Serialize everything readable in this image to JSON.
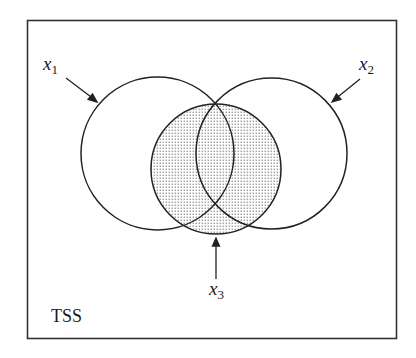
{
  "diagram": {
    "type": "venn",
    "frame_label": "TSS",
    "sets": [
      {
        "id": "x1",
        "symbol": "x",
        "subscript": "1",
        "shaded": false
      },
      {
        "id": "x2",
        "symbol": "x",
        "subscript": "2",
        "shaded": false
      },
      {
        "id": "x3",
        "symbol": "x",
        "subscript": "3",
        "shaded": true
      }
    ],
    "colors": {
      "stroke": "#222222",
      "frame": "#333333",
      "shade_dots": "#8a8a8a",
      "background": "#ffffff"
    }
  }
}
